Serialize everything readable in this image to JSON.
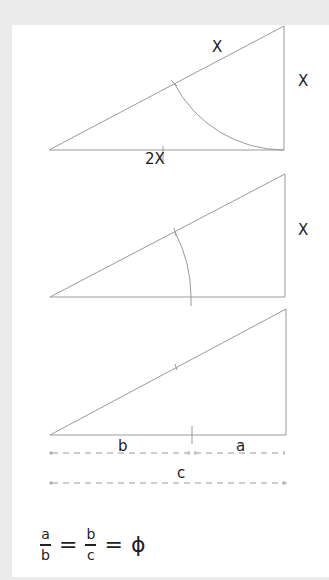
{
  "colors": {
    "background": "#ebebeb",
    "panel": "#ffffff",
    "stroke": "#9a9a9a",
    "text": "#222222"
  },
  "triangle_1": {
    "hypotenuse_label": "X",
    "side_label": "X",
    "base_label": "2X"
  },
  "triangle_2": {
    "side_label": "X"
  },
  "triangle_3": {
    "segment_b_label": "b",
    "segment_a_label": "a",
    "total_c_label": "c"
  },
  "formula": {
    "frac1_num": "a",
    "frac1_den": "b",
    "eq1": "=",
    "frac2_num": "b",
    "frac2_den": "c",
    "eq2": "=",
    "result": "ϕ"
  }
}
